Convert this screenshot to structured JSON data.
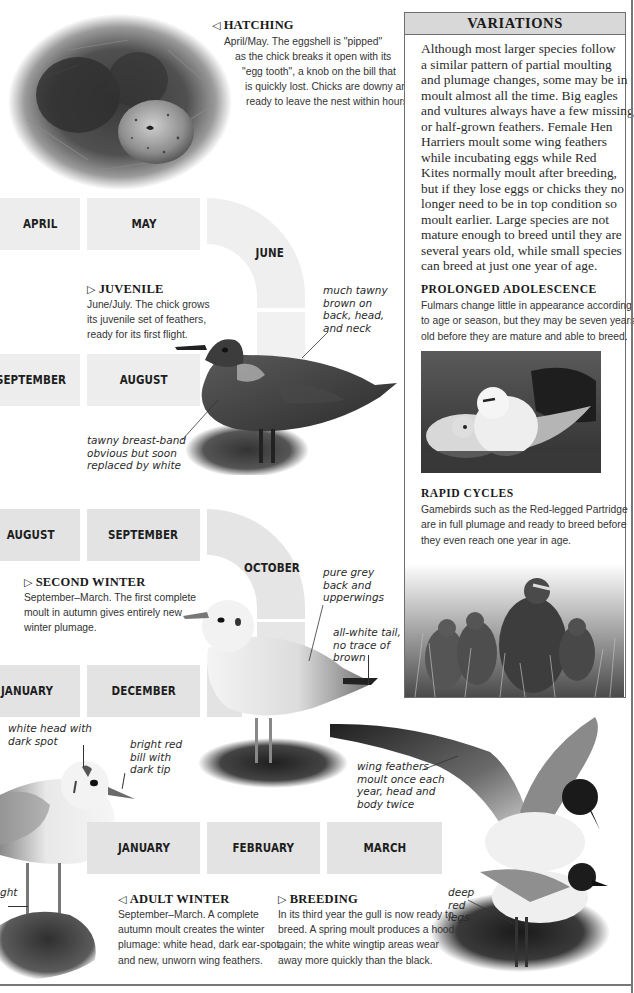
{
  "hatching": {
    "arrow": "◁",
    "title": "HATCHING",
    "lines": [
      "April/May. The eggshell is \"pipped\"",
      "as the chick breaks it open with its",
      "\"egg tooth\", a knob on the bill that",
      "is quickly lost. Chicks are downy and",
      "ready to leave the nest within hours."
    ],
    "image": "chick-and-egg-in-nest-photo"
  },
  "timeline": {
    "row1": [
      "APRIL",
      "MAY",
      "JUNE"
    ],
    "row2": [
      "SEPTEMBER",
      "AUGUST"
    ],
    "row3": [
      "AUGUST",
      "SEPTEMBER",
      "OCTOBER"
    ],
    "row4": [
      "JANUARY",
      "DECEMBER"
    ],
    "row5": [
      "JANUARY",
      "FEBRUARY",
      "MARCH"
    ]
  },
  "juvenile": {
    "arrow": "▷",
    "title": "JUVENILE",
    "lines": [
      "June/July. The chick grows",
      "its juvenile set of feathers,",
      "ready for its first flight."
    ],
    "notes": {
      "back": [
        "much tawny",
        "brown on",
        "back, head,",
        "and neck"
      ],
      "breast": [
        "tawny breast-band",
        "obvious but soon",
        "replaced by white"
      ]
    }
  },
  "second_winter": {
    "arrow": "▷",
    "title": "SECOND WINTER",
    "lines": [
      "September–March. The first complete",
      "moult in autumn gives entirely new",
      "winter plumage."
    ],
    "notes": {
      "back": [
        "pure grey",
        "back and",
        "upperwings"
      ],
      "tail": [
        "all-white tail,",
        "no trace of",
        "brown"
      ]
    }
  },
  "adult_winter": {
    "arrow": "◁",
    "title": "ADULT WINTER",
    "lines": [
      "September–March. A complete",
      "autumn moult creates the winter",
      "plumage: white head, dark ear-spot,",
      "and new, unworn wing feathers."
    ],
    "notes": {
      "head": [
        "white head with",
        "dark spot"
      ],
      "bill": [
        "bright red",
        "bill with",
        "dark tip"
      ],
      "legs_fragment": "ght"
    }
  },
  "breeding": {
    "arrow": "▷",
    "title": "BREEDING",
    "lines": [
      "In its third year the gull is now ready to",
      "breed. A spring moult produces a hood",
      "again; the white wingtip areas wear",
      "away more quickly than the black."
    ],
    "notes": {
      "wing": [
        "wing feathers",
        "moult once each",
        "year, head and",
        "body twice"
      ],
      "legs": [
        "deep",
        "red",
        "legs"
      ]
    }
  },
  "panel": {
    "title": "VARIATIONS",
    "body": [
      "Although most larger species follow",
      "a similar pattern of partial moulting",
      "and plumage changes, some may be in",
      "moult almost all the time. Big eagles",
      "and vultures always have a few missing",
      "or half-grown feathers. Female Hen",
      "Harriers moult some wing feathers",
      "while incubating eggs while Red",
      "Kites normally moult after breeding,",
      "but if they lose eggs or chicks they no",
      "longer need to be in top condition so",
      "moult earlier. Large species are not",
      "mature enough to breed until they are",
      "several years old, while small species",
      "can breed at just one year of age."
    ],
    "prolonged": {
      "title": "PROLONGED ADOLESCENCE",
      "lines": [
        "Fulmars change little in appearance according",
        "to age or season, but they may be seven years",
        "old before they are mature and able to breed."
      ],
      "image": "fulmar-chick-and-adult-photo"
    },
    "rapid": {
      "title": "RAPID CYCLES",
      "lines": [
        "Gamebirds such as the Red-legged Partridge",
        "are in full plumage and ready to breed before",
        "they even reach one year in age."
      ],
      "image": "red-legged-partridge-family-photo"
    }
  },
  "colors": {
    "month_block": "#ededed",
    "panel_header": "#d8d8d8",
    "panel_border": "#6f6f6f",
    "text": "#2a2a2a"
  }
}
